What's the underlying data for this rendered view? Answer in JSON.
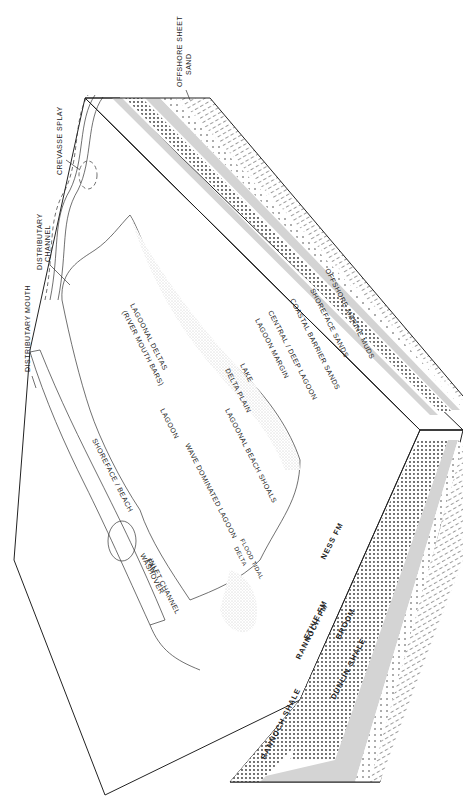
{
  "figure": {
    "type": "block-diagram",
    "orientation": "rotated 90 degrees (page landscape)"
  },
  "callouts": {
    "offshore_sheet_sand": [
      "OFFSHORE SHEET",
      "SAND"
    ],
    "crevasse_splay": "CREVASSE SPLAY",
    "distributary_channel": [
      "DISTRIBUTARY",
      "CHANNEL"
    ],
    "distributary_mouth": "DISTRIBUTARY MOUTH"
  },
  "surface_labels": {
    "shoreface_beach": "SHOREFACE / BEACH",
    "inlet_channel": "INLET CHANNEL",
    "washover_fan": [
      "WASHOVER",
      "FAN"
    ],
    "flood_tidal_delta": [
      "FLOOD TIDAL",
      "DELTA"
    ],
    "wave_dominated_lagoon": "WAVE DOMINATED LAGOON",
    "lagoonal_beach_shoals": "LAGOONAL BEACH SHOALS",
    "lagoonal_delta": [
      "LAGOONAL DELTAS",
      "(RIVER MOUTH BARS)"
    ],
    "lagoon": "LAGOON",
    "delta_plain": "DELTA PLAIN",
    "lake": "LAKE"
  },
  "section_labels": {
    "lagoon_margin": "LAGOON MARGIN",
    "central_deep_lagoon": "CENTRAL / DEEP LAGOON",
    "coastal_barrier_sands": "COASTAL BARRIER SANDS",
    "shoreface_sands": "SHOREFACE SANDS",
    "offshore_marine_muds": "OFFSHORE MARINE MUDS"
  },
  "formations": {
    "ness": "NESS FM",
    "etive": "ETIVE FM",
    "rannoch_fm": "RANNOCH FM",
    "rannoch_shale": "RANNOCH SHALE",
    "broom": "BROOM",
    "dunlin_shale": "DUNLIN SHALE"
  },
  "colors": {
    "ink": "#222222",
    "grey_band": "#d4d4d4",
    "stipple": "#444444",
    "paper": "#ffffff"
  }
}
